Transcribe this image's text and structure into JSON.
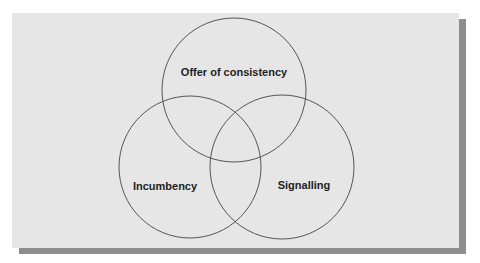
{
  "diagram": {
    "type": "venn",
    "colors": {
      "panel": "#e6e6e6",
      "shadow": "#8e8e8e",
      "stroke": "#555555",
      "text": "#1e1e1e"
    },
    "sets": [
      {
        "id": "top",
        "label": "Offer of consistency",
        "cx": 234,
        "cy": 90,
        "r": 72,
        "label_x": 234,
        "label_y": 72
      },
      {
        "id": "left",
        "label": "Incumbency",
        "cx": 190,
        "cy": 167,
        "r": 71,
        "label_x": 165,
        "label_y": 186
      },
      {
        "id": "right",
        "label": "Signalling",
        "cx": 282,
        "cy": 167,
        "r": 72,
        "label_x": 304,
        "label_y": 185
      }
    ]
  }
}
